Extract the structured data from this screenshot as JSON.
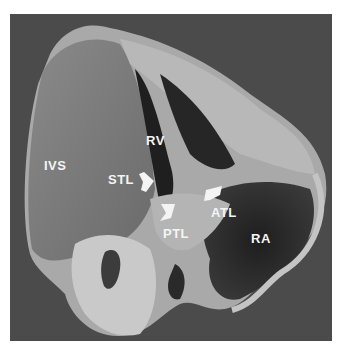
{
  "figure": {
    "background_color": "#4b4b4b",
    "page_color": "#ffffff",
    "label_color": "#f4f4f4",
    "labels": {
      "ivs": "IVS",
      "rv": "RV",
      "stl": "STL",
      "atl": "ATL",
      "ptl": "PTL",
      "ra": "RA"
    },
    "arrows": [
      {
        "name": "stl-arrowhead",
        "points_to": "STL"
      },
      {
        "name": "ptl-arrowhead",
        "points_to": "PTL"
      },
      {
        "name": "atl-arrowhead",
        "points_to": "ATL"
      }
    ]
  }
}
